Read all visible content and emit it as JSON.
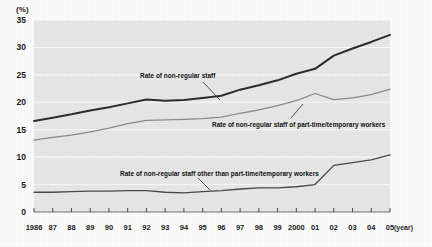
{
  "axes": {
    "y_unit_label": "(%)",
    "x_unit_label": "(year)",
    "y_ticks": [
      "0",
      "5",
      "10",
      "15",
      "20",
      "25",
      "30",
      "35"
    ],
    "x_ticks": [
      "1986",
      "87",
      "88",
      "89",
      "90",
      "91",
      "92",
      "93",
      "94",
      "95",
      "96",
      "97",
      "98",
      "99",
      "2000",
      "01",
      "02",
      "03",
      "04",
      "05"
    ]
  },
  "annotations": {
    "series1": "Rate of non-regular staff",
    "series2": "Rate of non-regular staff of part-time/temporary workers",
    "series3": "Rate of non-regular staff other than part-time/temporary workers"
  },
  "colors": {
    "plot_background": "#e8e8e8",
    "gridline": "#fbfbfb",
    "series1": "#2e2e2e",
    "series2": "#8c8c8c",
    "series3": "#4a4a4a",
    "text": "#1b1b1b"
  },
  "chart_data": {
    "type": "line",
    "title": "",
    "subtitle": "",
    "xlabel": "(year)",
    "ylabel": "(%)",
    "xlim": [
      1986,
      2005
    ],
    "ylim": [
      0,
      35
    ],
    "grid": true,
    "legend": "inline-annotations",
    "x": [
      1986,
      1987,
      1988,
      1989,
      1990,
      1991,
      1992,
      1993,
      1994,
      1995,
      1996,
      1997,
      1998,
      1999,
      2000,
      2001,
      2002,
      2003,
      2004,
      2005
    ],
    "categories": [
      "1986",
      "87",
      "88",
      "89",
      "90",
      "91",
      "92",
      "93",
      "94",
      "95",
      "96",
      "97",
      "98",
      "99",
      "2000",
      "01",
      "02",
      "03",
      "04",
      "05"
    ],
    "series": [
      {
        "name": "Rate of non-regular staff",
        "values": [
          16.6,
          17.2,
          17.8,
          18.5,
          19.1,
          19.8,
          20.5,
          20.3,
          20.4,
          20.8,
          21.2,
          22.3,
          23.1,
          24.0,
          25.2,
          26.1,
          28.5,
          29.8,
          31.0,
          32.3
        ]
      },
      {
        "name": "Rate of non-regular staff of part-time/temporary workers",
        "values": [
          13.1,
          13.6,
          14.0,
          14.6,
          15.3,
          16.1,
          16.7,
          16.8,
          16.9,
          17.0,
          17.3,
          18.0,
          18.6,
          19.4,
          20.3,
          21.6,
          20.5,
          20.8,
          21.4,
          22.4
        ]
      },
      {
        "name": "Rate of non-regular staff other than part-time/temporary workers",
        "values": [
          3.6,
          3.6,
          3.7,
          3.8,
          3.8,
          3.9,
          3.9,
          3.6,
          3.5,
          3.7,
          3.9,
          4.2,
          4.4,
          4.4,
          4.6,
          5.0,
          8.5,
          9.0,
          9.5,
          10.4
        ]
      }
    ]
  }
}
